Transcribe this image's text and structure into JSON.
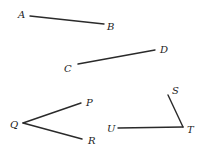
{
  "diagram": {
    "segments": [
      {
        "name": "AB",
        "points": [
          "A",
          "B"
        ]
      },
      {
        "name": "CD",
        "points": [
          "C",
          "D"
        ]
      },
      {
        "name": "QP",
        "points": [
          "Q",
          "P"
        ]
      },
      {
        "name": "QR",
        "points": [
          "Q",
          "R"
        ]
      },
      {
        "name": "UT",
        "points": [
          "U",
          "T"
        ]
      },
      {
        "name": "ST",
        "points": [
          "S",
          "T"
        ]
      }
    ],
    "labels": {
      "A": "A",
      "B": "B",
      "C": "C",
      "D": "D",
      "P": "P",
      "Q": "Q",
      "R": "R",
      "S": "S",
      "T": "T",
      "U": "U"
    },
    "angles": [
      {
        "name": "PQR",
        "vertex": "Q"
      },
      {
        "name": "STU",
        "vertex": "T"
      }
    ]
  }
}
